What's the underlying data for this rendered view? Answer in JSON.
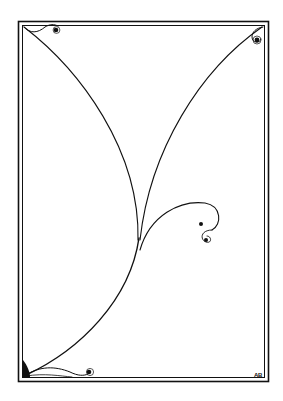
{
  "artwork": {
    "type": "decorative line illustration",
    "background": "#ffffff",
    "ink": "#111111",
    "frame": {
      "outer": {
        "x": 18,
        "y": 21,
        "w": 251,
        "h": 361
      },
      "inner": {
        "x": 22,
        "y": 25,
        "w": 243,
        "h": 353
      }
    },
    "monogram": "AB"
  }
}
